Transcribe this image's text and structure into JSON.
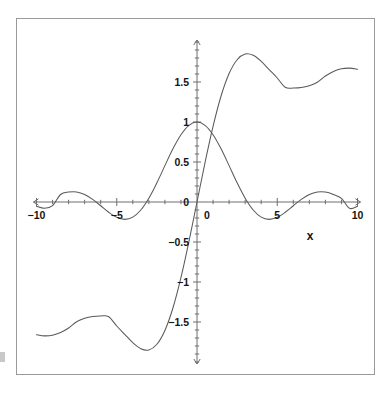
{
  "chart_data": {
    "type": "line",
    "title": "",
    "subtitle": "",
    "xlabel": "x",
    "ylabel": "",
    "xlim": [
      -10,
      10
    ],
    "ylim": [
      -2.0,
      2.0
    ],
    "grid": false,
    "legend": "none",
    "x_ticks_labeled": [
      "-10",
      "-5",
      "0",
      "5",
      "10"
    ],
    "x_tick_values": [
      -10,
      -5,
      0,
      5,
      10
    ],
    "x_minor_tick_step": 1,
    "y_ticks_labeled": [
      "1.5",
      "1",
      "0.5",
      "0",
      "-0.5",
      "-1",
      "-1.5"
    ],
    "y_tick_values": [
      1.5,
      1,
      0.5,
      0,
      -0.5,
      -1,
      -1.5
    ],
    "y_minor_tick_step": 0.1,
    "axes_style": "crossed-arrows-at-origin",
    "series": [
      {
        "name": "sinc",
        "expression": "sin(x)/x",
        "color": "#5a5a5a",
        "x": [
          -10,
          -9.5,
          -9,
          -8.5,
          -8,
          -7.5,
          -7,
          -6.5,
          -6,
          -5.5,
          -5,
          -4.5,
          -4,
          -3.5,
          -3,
          -2.5,
          -2,
          -1.5,
          -1,
          -0.5,
          0,
          0.5,
          1,
          1.5,
          2,
          2.5,
          3,
          3.5,
          4,
          4.5,
          5,
          5.5,
          6,
          6.5,
          7,
          7.5,
          8,
          8.5,
          9,
          9.5,
          10
        ],
        "values": [
          -0.0544,
          -0.079,
          -0.0458,
          0.0939,
          0.1237,
          0.1252,
          0.0939,
          0.0331,
          -0.0466,
          -0.1278,
          -0.1918,
          -0.2172,
          -0.1892,
          -0.1002,
          0.047,
          0.2394,
          0.4546,
          0.665,
          0.8415,
          0.9589,
          1.0,
          0.9589,
          0.8415,
          0.665,
          0.4546,
          0.2394,
          0.047,
          -0.1002,
          -0.1892,
          -0.2172,
          -0.1918,
          -0.1278,
          -0.0466,
          0.0331,
          0.0939,
          0.1252,
          0.1237,
          0.0939,
          0.0458,
          -0.079,
          -0.0544
        ]
      },
      {
        "name": "Si",
        "expression": "Si(x)",
        "color": "#5a5a5a",
        "x": [
          -10,
          -9.5,
          -9,
          -8.5,
          -8,
          -7.5,
          -7,
          -6.5,
          -6,
          -5.5,
          -5,
          -4.5,
          -4,
          -3.5,
          -3,
          -2.5,
          -2,
          -1.5,
          -1,
          -0.5,
          0,
          0.5,
          1,
          1.5,
          2,
          2.5,
          3,
          3.5,
          4,
          4.5,
          5,
          5.5,
          6,
          6.5,
          7,
          7.5,
          8,
          8.5,
          9,
          9.5,
          10
        ],
        "values": [
          -1.6583,
          -1.6732,
          -1.665,
          -1.6316,
          -1.5742,
          -1.4978,
          -1.4546,
          -1.4309,
          -1.4247,
          -1.4338,
          -1.5499,
          -1.6541,
          -1.7582,
          -1.8331,
          -1.8487,
          -1.7785,
          -1.6054,
          -1.3247,
          -0.9461,
          -0.4931,
          0.0,
          0.4931,
          0.9461,
          1.3247,
          1.6054,
          1.7785,
          1.8487,
          1.8331,
          1.7582,
          1.6541,
          1.5499,
          1.4338,
          1.4247,
          1.4309,
          1.4546,
          1.4978,
          1.5742,
          1.6316,
          1.665,
          1.6732,
          1.6583
        ]
      }
    ],
    "annotations": [],
    "asymptote_note": "Si(x) oscillates toward pi/2 = 1.5708"
  },
  "figure": {
    "border_color": "#9a9a9a",
    "background": "#ffffff",
    "axis_color": "#6e6e6e",
    "curve_color": "#5a5a5a"
  }
}
